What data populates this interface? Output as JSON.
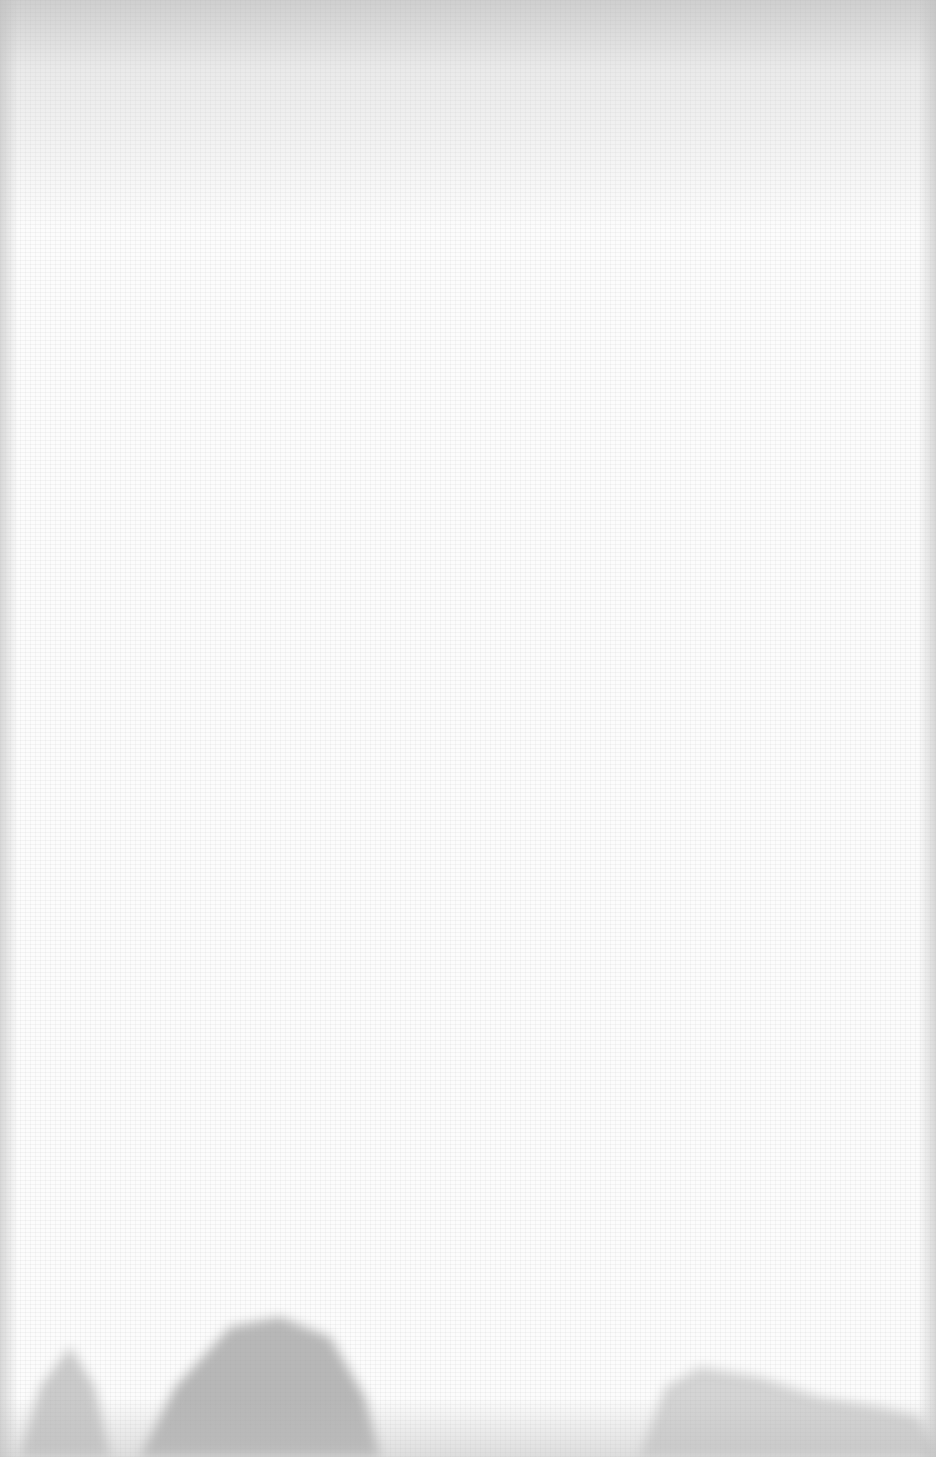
{
  "canvas": {
    "description": "Blank textured paper background",
    "background_color": "#fcfcfc",
    "vignette_color": "#aaaaaa",
    "silhouette_color": "#9a9a9a"
  }
}
